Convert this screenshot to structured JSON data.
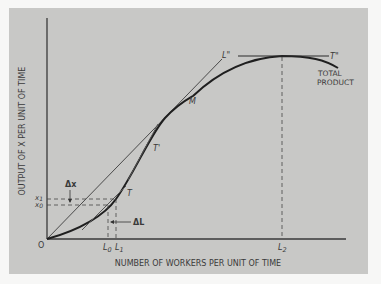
{
  "diagram": {
    "x_axis_label": "NUMBER OF WORKERS PER UNIT OF TIME",
    "y_axis_label": "OUTPUT OF X PER UNIT OF TIME",
    "origin_label": "O",
    "curve_label_line1": "TOTAL",
    "curve_label_line2": "PRODUCT",
    "point_labels": {
      "T": "T",
      "T_prime": "T'",
      "T_double_prime": "T\"",
      "M": "M",
      "L_double_prime": "L\""
    },
    "x_ticks": {
      "L0": "L",
      "L0_sub": "0",
      "L1": "L",
      "L1_sub": "1",
      "L2": "L",
      "L2_sub": "2"
    },
    "y_ticks": {
      "x1": "x",
      "x1_sub": "1",
      "x0": "x",
      "x0_sub": "0"
    },
    "delta_labels": {
      "delta_x": "Δx",
      "delta_L": "ΔL"
    }
  },
  "colors": {
    "panel_bg": "#c8c8c6",
    "page_bg": "#f7f7f6",
    "ink": "#2a2a2a"
  }
}
